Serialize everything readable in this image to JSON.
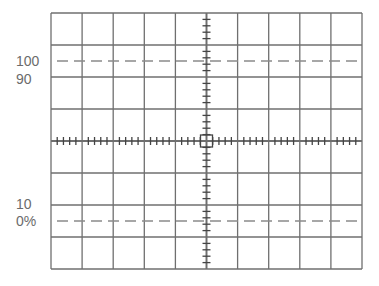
{
  "graticule": {
    "x": 51,
    "y": 13,
    "width": 311,
    "height": 256,
    "cols": 10,
    "rows": 8,
    "subdivisions": 5,
    "tick_half_length": 4,
    "line_color": "#6f6f6f",
    "dash_color": "#8a8a8a"
  },
  "reference_lines": [
    {
      "name": "level-100",
      "y": 61
    },
    {
      "name": "level-0",
      "y": 221
    }
  ],
  "labels": [
    {
      "name": "label-100",
      "text": "100",
      "x": 16,
      "y": 54
    },
    {
      "name": "label-90",
      "text": "90",
      "x": 16,
      "y": 72
    },
    {
      "name": "label-10",
      "text": "10",
      "x": 16,
      "y": 197
    },
    {
      "name": "label-0-percent",
      "text": "0%",
      "x": 16,
      "y": 214
    }
  ]
}
